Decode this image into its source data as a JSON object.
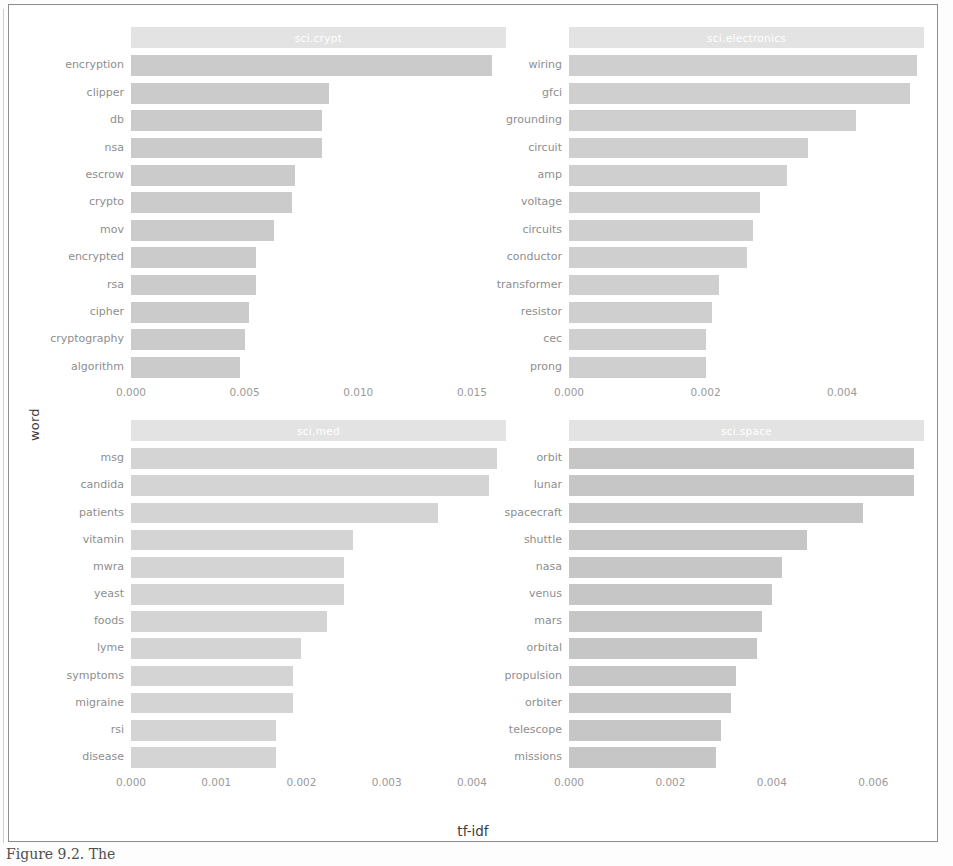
{
  "figure": {
    "xlabel": "tf-idf",
    "ylabel": "word",
    "caption": "Figure 9.2. The "
  },
  "chart_data": {
    "type": "bar",
    "title": "",
    "xlabel": "tf-idf",
    "ylabel": "word",
    "orientation": "horizontal",
    "grid": false,
    "legend": false,
    "facets": [
      {
        "name": "sci.crypt",
        "xlim": [
          0,
          0.0165
        ],
        "xticks": [
          "0.000",
          "0.005",
          "0.010",
          "0.015"
        ],
        "xtickvalues": [
          0.0,
          0.005,
          0.01,
          0.015
        ],
        "categories": [
          "encryption",
          "clipper",
          "db",
          "nsa",
          "escrow",
          "crypto",
          "mov",
          "encrypted",
          "rsa",
          "cipher",
          "cryptography",
          "algorithm"
        ],
        "values": [
          0.0159,
          0.0087,
          0.0084,
          0.0084,
          0.0072,
          0.0071,
          0.0063,
          0.0055,
          0.0055,
          0.0052,
          0.005,
          0.0048
        ]
      },
      {
        "name": "sci.electronics",
        "xlim": [
          0,
          0.0052
        ],
        "xticks": [
          "0.000",
          "0.002",
          "0.004"
        ],
        "xtickvalues": [
          0.0,
          0.002,
          0.004
        ],
        "categories": [
          "wiring",
          "gfci",
          "grounding",
          "circuit",
          "amp",
          "voltage",
          "circuits",
          "conductor",
          "transformer",
          "resistor",
          "cec",
          "prong"
        ],
        "values": [
          0.0051,
          0.005,
          0.0042,
          0.0035,
          0.0032,
          0.0028,
          0.0027,
          0.0026,
          0.0022,
          0.0021,
          0.002,
          0.002
        ]
      },
      {
        "name": "sci.med",
        "xlim": [
          0,
          0.0044
        ],
        "xticks": [
          "0.000",
          "0.001",
          "0.002",
          "0.003",
          "0.004"
        ],
        "xtickvalues": [
          0.0,
          0.001,
          0.002,
          0.003,
          0.004
        ],
        "categories": [
          "msg",
          "candida",
          "patients",
          "vitamin",
          "mwra",
          "yeast",
          "foods",
          "lyme",
          "symptoms",
          "migraine",
          "rsi",
          "disease"
        ],
        "values": [
          0.0043,
          0.0042,
          0.0036,
          0.0026,
          0.0025,
          0.0025,
          0.0023,
          0.002,
          0.0019,
          0.0019,
          0.0017,
          0.0017
        ]
      },
      {
        "name": "sci.space",
        "xlim": [
          0,
          0.007
        ],
        "xticks": [
          "0.000",
          "0.002",
          "0.004",
          "0.006"
        ],
        "xtickvalues": [
          0.0,
          0.002,
          0.004,
          0.006
        ],
        "categories": [
          "orbit",
          "lunar",
          "spacecraft",
          "shuttle",
          "nasa",
          "venus",
          "mars",
          "orbital",
          "propulsion",
          "orbiter",
          "telescope",
          "missions"
        ],
        "values": [
          0.0068,
          0.0068,
          0.0058,
          0.0047,
          0.0042,
          0.004,
          0.0038,
          0.0037,
          0.0033,
          0.0032,
          0.003,
          0.0029
        ]
      }
    ]
  },
  "colors": {
    "bar": "#cfcfcf",
    "strip": "#e3e3e3",
    "strip_text": "#ffffff",
    "tick_text": "#9a9a9a",
    "axis_title": "#3d3d3d",
    "frame": "#8c8c8c"
  }
}
